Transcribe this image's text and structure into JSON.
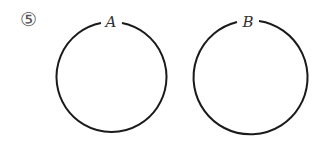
{
  "problem": {
    "number": "⑤"
  },
  "diagram": {
    "sets": [
      {
        "name": "A",
        "cx": 110,
        "cy": 77,
        "r": 55
      },
      {
        "name": "B",
        "cx": 250,
        "cy": 76,
        "r": 57
      }
    ],
    "stroke_color": "#1a1a1a"
  }
}
